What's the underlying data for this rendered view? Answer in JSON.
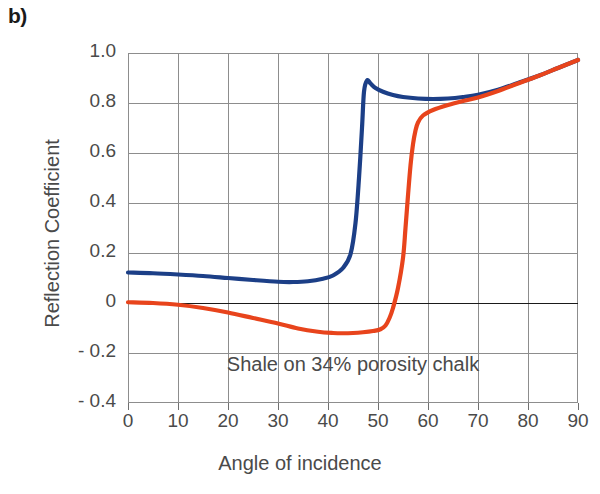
{
  "figure": {
    "panel_label": "b)"
  },
  "chart_data": {
    "type": "line",
    "title": "",
    "subtitle": "",
    "xlabel": "Angle of incidence",
    "ylabel": "Reflection Coefficient",
    "annotation": "Shale on 34% porosity chalk",
    "xlim": [
      0,
      90
    ],
    "ylim": [
      -0.4,
      1.0
    ],
    "grid": true,
    "legend_position": "none",
    "zero_line": 0,
    "xticks": [
      0,
      10,
      20,
      30,
      40,
      50,
      60,
      70,
      80,
      90
    ],
    "xtick_labels": [
      "0",
      "10",
      "20",
      "30",
      "40",
      "50",
      "60",
      "70",
      "80",
      "90"
    ],
    "yticks": [
      1.0,
      0.8,
      0.6,
      0.4,
      0.2,
      0,
      -0.2,
      -0.4
    ],
    "ytick_labels": [
      "1.0",
      "0.8",
      "0.6",
      "0.4",
      "0.2",
      "0",
      "- 0.2",
      "- 0.4"
    ],
    "colors": {
      "series_blue": "#1c3f87",
      "series_red": "#e8441c",
      "grid": "#8d8d8d",
      "axis_text": "#4a4a4a",
      "zero_line": "#1a1a1a"
    },
    "series": [
      {
        "name": "series-blue",
        "color": "#1c3f87",
        "x": [
          0,
          5,
          10,
          15,
          20,
          25,
          30,
          33,
          36,
          39,
          41,
          43,
          44.5,
          45.5,
          46.2,
          46.8,
          47.2,
          47.8,
          48.5,
          49.5,
          51,
          53,
          55,
          58,
          61,
          64,
          67,
          70,
          74,
          78,
          82,
          86,
          90
        ],
        "y": [
          0.122,
          0.119,
          0.114,
          0.108,
          0.1,
          0.092,
          0.085,
          0.084,
          0.087,
          0.097,
          0.11,
          0.14,
          0.195,
          0.32,
          0.5,
          0.7,
          0.845,
          0.89,
          0.878,
          0.86,
          0.845,
          0.832,
          0.824,
          0.818,
          0.816,
          0.818,
          0.824,
          0.833,
          0.853,
          0.88,
          0.908,
          0.94,
          0.972
        ]
      },
      {
        "name": "series-red",
        "color": "#e8441c",
        "x": [
          0,
          5,
          10,
          15,
          20,
          25,
          30,
          34,
          38,
          41,
          43,
          45,
          47,
          49,
          50.5,
          51.5,
          52.3,
          53,
          54,
          55,
          55.5,
          56,
          56.5,
          57,
          57.5,
          58,
          59,
          61,
          64,
          67,
          70,
          74,
          78,
          82,
          86,
          90
        ],
        "y": [
          0.003,
          0.0,
          -0.007,
          -0.02,
          -0.038,
          -0.06,
          -0.082,
          -0.102,
          -0.115,
          -0.12,
          -0.121,
          -0.12,
          -0.117,
          -0.112,
          -0.105,
          -0.09,
          -0.06,
          -0.02,
          0.06,
          0.18,
          0.3,
          0.43,
          0.55,
          0.635,
          0.69,
          0.722,
          0.75,
          0.772,
          0.792,
          0.808,
          0.822,
          0.848,
          0.878,
          0.908,
          0.94,
          0.972
        ]
      }
    ],
    "features": {
      "blue_peak_x": 47.8,
      "blue_peak_y": 0.89,
      "blue_min_x": 33,
      "blue_min_y": 0.084,
      "blue_intercept_y": 0.122,
      "red_min_x": 43,
      "red_min_y": -0.121,
      "red_intercept_y": 0.003,
      "red_zero_crossing_x": 53.2
    }
  }
}
